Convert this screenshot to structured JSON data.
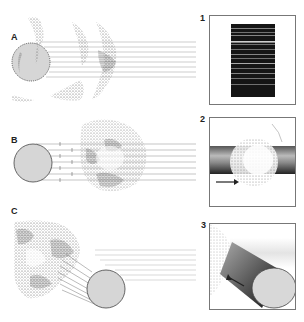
{
  "figure": {
    "panels": [
      {
        "id": "A",
        "label": "A",
        "description": "Star partially obscured by dusty nebula; sight lines pass through cloud"
      },
      {
        "id": "B",
        "label": "B",
        "description": "Star with arrows of light passing through the nebula cloud"
      },
      {
        "id": "C",
        "label": "C",
        "description": "Star illuminating cloud at an angle; light reflected back"
      }
    ],
    "insets": [
      {
        "id": "1",
        "label": "1",
        "description": "Absorption spectrum, dark bands with thin bright lines"
      },
      {
        "id": "2",
        "label": "2",
        "description": "Cylinder of light passing through cloud, arrow pointing right"
      },
      {
        "id": "3",
        "label": "3",
        "description": "Cylinder seen obliquely, arrow pointing up-left toward cloud"
      }
    ],
    "colors": {
      "star_fill": "#d6d6d6",
      "star_stroke": "#444444",
      "line": "#9a9a9a",
      "frame": "#777777",
      "dust": "#555555"
    }
  }
}
